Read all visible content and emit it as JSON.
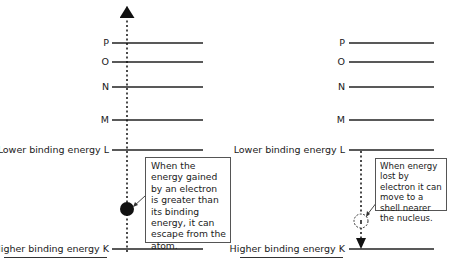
{
  "left_panel": {
    "shells": [
      {
        "label": "P",
        "y": 43
      },
      {
        "label": "O",
        "y": 62
      },
      {
        "label": "N",
        "y": 87
      },
      {
        "label": "M",
        "y": 120
      },
      {
        "label": "Lower binding energy L",
        "y": 150
      },
      {
        "label": "Higher binding energy K",
        "y": 249
      }
    ],
    "callout": "When the energy gained by an electron is greater than its binding energy, it can escape from the atom.",
    "electron": "filled"
  },
  "right_panel": {
    "shells": [
      {
        "label": "P",
        "y": 43
      },
      {
        "label": "O",
        "y": 62
      },
      {
        "label": "N",
        "y": 87
      },
      {
        "label": "M",
        "y": 120
      },
      {
        "label": "Lower binding energy L",
        "y": 150
      },
      {
        "label": "Higher binding energy K",
        "y": 249
      }
    ],
    "callout": "When energy lost by electron it can move to a shell nearer the nucleus.",
    "electron": "hollow"
  }
}
